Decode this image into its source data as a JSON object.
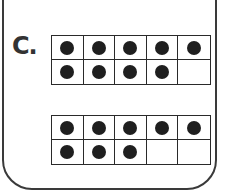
{
  "problem": {
    "label": "C.",
    "frames": [
      {
        "name": "top-ten-frame",
        "rows": 2,
        "cols": 5,
        "filled": [
          [
            true,
            true,
            true,
            true,
            true
          ],
          [
            true,
            true,
            true,
            true,
            false
          ]
        ],
        "count": 9
      },
      {
        "name": "bottom-ten-frame",
        "rows": 2,
        "cols": 5,
        "filled": [
          [
            true,
            true,
            true,
            true,
            true
          ],
          [
            true,
            true,
            true,
            false,
            false
          ]
        ],
        "count": 8
      }
    ]
  },
  "colors": {
    "border": "#2a2a2a",
    "counter": "#1f1f1f",
    "background": "#ffffff"
  }
}
